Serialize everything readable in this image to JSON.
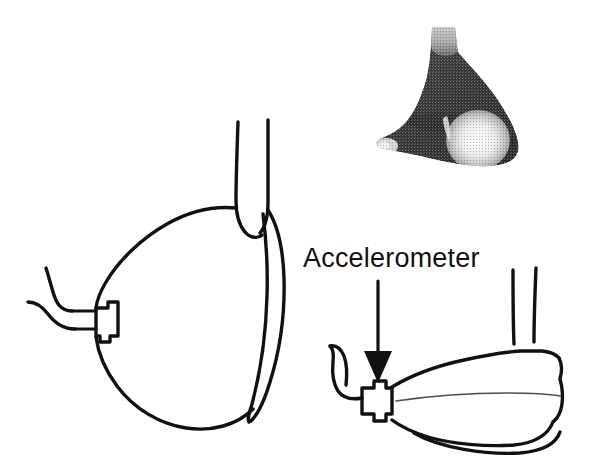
{
  "figure": {
    "background_color": "#ffffff",
    "ink_color": "#111111",
    "width": 606,
    "height": 471
  },
  "annotations": {
    "accelerometer_label": "Accelerometer",
    "arrow_name": "arrow pointing down to accelerometer"
  },
  "panels": {
    "photo_inset": {
      "name": "grayscale photograph of mask with accelerometer",
      "dark_body_color": "#3a3a3a",
      "neck_color": "#b9b9b9",
      "highlight_color": "#f2f2f2",
      "nub_color": "#d8d8d8"
    },
    "front_view": {
      "name": "front view line drawing of mask",
      "parts": [
        "body outline",
        "neck tube",
        "rim profile",
        "accelerometer block",
        "wire leads"
      ]
    },
    "side_view": {
      "name": "side view line drawing of mask",
      "parts": [
        "body outline",
        "two tubes",
        "seam line",
        "rim line",
        "accelerometer block",
        "wire lead"
      ]
    }
  },
  "icons": {
    "accelerometer_block": "accelerometer-block-icon",
    "wire_lead": "wire-lead-icon",
    "down_arrow": "arrow-down-icon"
  }
}
